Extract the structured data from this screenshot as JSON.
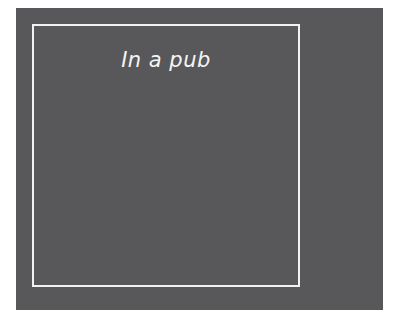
{
  "panel": {
    "background_color": "#58585a",
    "frame_color": "#f2f2f2",
    "caption": "In a pub"
  }
}
